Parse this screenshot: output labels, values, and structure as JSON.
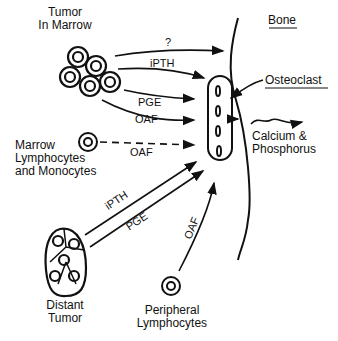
{
  "labels": {
    "tumor_in_marrow": "Tumor\nIn Marrow",
    "tumor_line1": "Tumor",
    "tumor_line2": "In Marrow",
    "marrow_line1": "Marrow",
    "marrow_line2": "Lymphocytes",
    "marrow_line3": "and Monocytes",
    "distant_line1": "Distant",
    "distant_line2": "Tumor",
    "peripheral_line1": "Peripheral",
    "peripheral_line2": "Lymphocytes",
    "bone": "Bone",
    "osteoclast": "Osteoclast",
    "calcium_line1": "Calcium &",
    "calcium_line2": "Phosphorus"
  },
  "arrows": {
    "unknown": "?",
    "ipth_marrow": "iPTH",
    "pge_marrow": "PGE",
    "oaf_marrow": "OAF",
    "oaf_lymph": "OAF",
    "ipth_distant": "iPTH",
    "pge_distant": "PGE",
    "oaf_peripheral": "OAF"
  }
}
